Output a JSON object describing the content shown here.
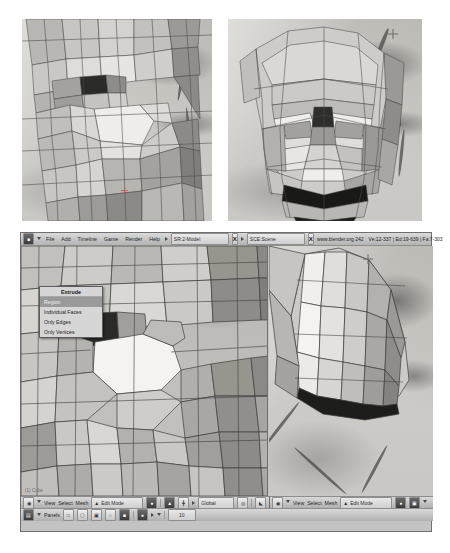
{
  "figure": {
    "top_left_caption": "",
    "top_right_caption": ""
  },
  "app": {
    "title": "Blender",
    "version_info": "www.blender.org 242",
    "stats": "Ve:12-337 | Ed:19-639 | Fa:7-303"
  },
  "header": {
    "menus": [
      "File",
      "Add",
      "Timeline",
      "Game",
      "Render",
      "Help"
    ],
    "screen_selector": "SR:2-Model",
    "scene_selector": "SCE:Scene",
    "close_label": "X",
    "window_type_icon": "window-type-icon",
    "collapse_icon": "collapse-icon"
  },
  "extrude_menu": {
    "title": "Extrude",
    "items": [
      {
        "label": "Region",
        "selected": true
      },
      {
        "label": "Individual Faces",
        "selected": false
      },
      {
        "label": "Only Edges",
        "selected": false
      },
      {
        "label": "Only Vertices",
        "selected": false
      }
    ]
  },
  "viewport_left": {
    "menus": [
      "View",
      "Select",
      "Mesh"
    ],
    "mode": "Edit Mode",
    "transform_orientation": "Global",
    "overlay_label": "(1) Cube",
    "editor_type_icon": "3d-view-icon",
    "draw_type_icon": "shading-solid-icon",
    "layer_icon": "layers-icon",
    "pivot_icon": "pivot-icon",
    "snap_icon": "snap-magnet-icon",
    "vertex_select_icon": "vertex-select-icon",
    "edge_select_icon": "edge-select-icon",
    "face_select_icon": "face-select-icon"
  },
  "viewport_right": {
    "menus": [
      "View",
      "Select",
      "Mesh"
    ],
    "mode": "Edit Mode",
    "editor_type_icon": "3d-view-icon",
    "draw_type_icon": "shading-solid-icon",
    "layer_icon": "layers-icon"
  },
  "panels_bar": {
    "label": "Panels",
    "context_value": "10",
    "editor_type_icon": "buttons-window-icon",
    "buttons": [
      "view-panel-icon",
      "render-panel-icon",
      "editing-panel-icon",
      "scene-panel-icon",
      "object-panel-icon",
      "world-panel-icon",
      "material-panel-icon"
    ]
  },
  "colors": {
    "window_bg": "#c3c3c3",
    "header_bg": "#cfcfcf",
    "viewport_bg": "#b5b4b0",
    "menu_bg": "#d6d6d6",
    "menu_selected": "#9a9a9a",
    "border": "#6f6f6f",
    "cursor_red": "#d9453b"
  }
}
